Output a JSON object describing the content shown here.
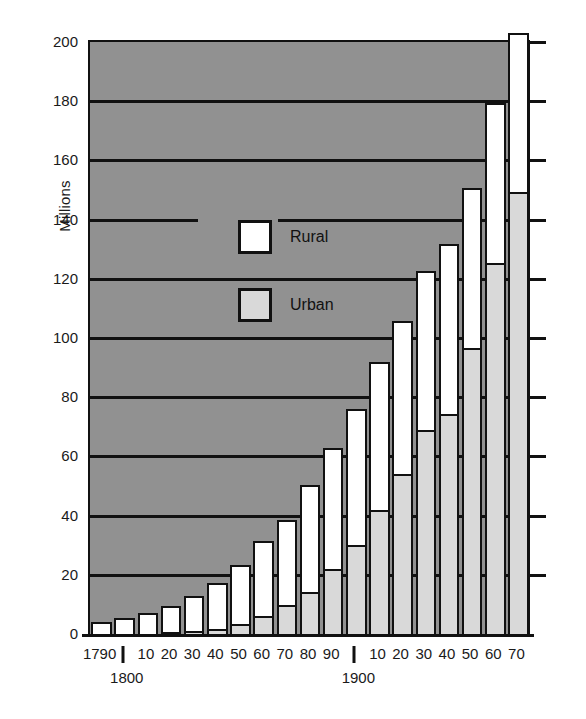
{
  "chart_data": {
    "type": "bar",
    "title": "",
    "subtitle": "",
    "xlabel": "",
    "ylabel": "Millions",
    "ylim": [
      0,
      200
    ],
    "ytick_values": [
      0,
      20,
      40,
      60,
      80,
      100,
      120,
      140,
      160,
      180,
      200
    ],
    "ytick_labels": [
      "0",
      "20",
      "40",
      "60",
      "80",
      "100",
      "120",
      "140",
      "160",
      "180",
      "200"
    ],
    "grid": true,
    "grid_axis": "y",
    "legend_position": "inside-upper-left",
    "stacked": true,
    "stack_order": [
      "Urban",
      "Rural"
    ],
    "categories": [
      "1790",
      "1800",
      "10",
      "20",
      "30",
      "40",
      "50",
      "60",
      "70",
      "80",
      "90",
      "1900",
      "10",
      "20",
      "30",
      "40",
      "50",
      "60",
      "70"
    ],
    "category_years": [
      1790,
      1800,
      1810,
      1820,
      1830,
      1840,
      1850,
      1860,
      1870,
      1880,
      1890,
      1900,
      1910,
      1920,
      1930,
      1940,
      1950,
      1960,
      1970
    ],
    "series": [
      {
        "name": "Urban",
        "color": "#d9d9d9",
        "values": [
          0.2,
          0.3,
          0.5,
          0.7,
          1.1,
          1.8,
          3.5,
          6.2,
          9.9,
          14.1,
          22.1,
          30.2,
          42.0,
          54.2,
          69.0,
          74.4,
          96.5,
          125.3,
          149.3
        ]
      },
      {
        "name": "Rural",
        "color": "#ffffff",
        "values": [
          3.7,
          5.0,
          6.7,
          8.9,
          11.7,
          15.2,
          19.6,
          25.2,
          28.7,
          36.0,
          40.8,
          45.8,
          49.9,
          51.6,
          53.8,
          57.2,
          54.2,
          54.1,
          53.9
        ]
      }
    ],
    "totals": [
      3.9,
      5.3,
      7.2,
      9.6,
      12.9,
      17.1,
      23.2,
      31.4,
      38.6,
      50.2,
      62.9,
      76.0,
      92.0,
      105.7,
      122.8,
      131.7,
      150.7,
      179.3,
      203.2
    ],
    "bar_count": 19
  },
  "axis": {
    "y_title": "Millions",
    "y_ticks": [
      "200",
      "180",
      "160",
      "140",
      "120",
      "100",
      "80",
      "60",
      "40",
      "20",
      "0"
    ],
    "x_ticks": [
      {
        "label": "1790",
        "type": "year"
      },
      {
        "label": "1800",
        "type": "century-marker"
      },
      {
        "label": "10",
        "type": "year"
      },
      {
        "label": "20",
        "type": "year"
      },
      {
        "label": "30",
        "type": "year"
      },
      {
        "label": "40",
        "type": "year"
      },
      {
        "label": "50",
        "type": "year"
      },
      {
        "label": "60",
        "type": "year"
      },
      {
        "label": "70",
        "type": "year"
      },
      {
        "label": "80",
        "type": "year"
      },
      {
        "label": "90",
        "type": "year"
      },
      {
        "label": "1900",
        "type": "century-marker"
      },
      {
        "label": "10",
        "type": "year"
      },
      {
        "label": "20",
        "type": "year"
      },
      {
        "label": "30",
        "type": "year"
      },
      {
        "label": "40",
        "type": "year"
      },
      {
        "label": "50",
        "type": "year"
      },
      {
        "label": "60",
        "type": "year"
      },
      {
        "label": "70",
        "type": "year"
      }
    ],
    "century_markers": [
      "1800",
      "1900"
    ]
  },
  "legend": {
    "entries": [
      {
        "label": "Rural",
        "swatch": "rural"
      },
      {
        "label": "Urban",
        "swatch": "urban"
      }
    ]
  },
  "colors": {
    "plot_background": "#919191",
    "rural_fill": "#ffffff",
    "urban_fill": "#d9d9d9",
    "axis_line": "#111111",
    "page_background": "#ffffff"
  }
}
